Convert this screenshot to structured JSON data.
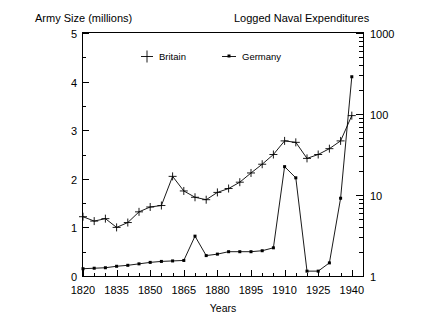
{
  "titles": {
    "left_title": "Army Size (millions)",
    "right_title": "Logged Naval Expenditures",
    "xlabel": "Years"
  },
  "legend": {
    "items": [
      {
        "label": "Britain",
        "marker": "plus-marker"
      },
      {
        "label": "Germany",
        "marker": "dot-line-marker"
      }
    ]
  },
  "axes": {
    "left_ticks": [
      "0",
      "1",
      "2",
      "3",
      "4",
      "5"
    ],
    "right_ticks": [
      "1",
      "10",
      "100",
      "1000"
    ],
    "x_ticks": [
      "1820",
      "1835",
      "1850",
      "1865",
      "1880",
      "1895",
      "1910",
      "1925",
      "1940"
    ]
  },
  "chart_data": {
    "type": "line",
    "title": "",
    "subtitle": "",
    "xlabel": "Years",
    "ylabel": "Army Size (millions)",
    "y2label": "Logged Naval Expenditures",
    "xlim": [
      1820,
      1945
    ],
    "ylim": [
      0,
      5
    ],
    "y2lim": [
      1,
      1000
    ],
    "y2scale": "log",
    "grid": false,
    "legend_position": "top-center-inside",
    "xticks": [
      1820,
      1835,
      1850,
      1865,
      1880,
      1895,
      1910,
      1925,
      1940
    ],
    "xminor_step": 5,
    "yticks": [
      0,
      1,
      2,
      3,
      4,
      5
    ],
    "y2ticks": [
      1,
      10,
      100,
      1000
    ],
    "series": [
      {
        "name": "Britain",
        "axis": "left",
        "marker": "plus",
        "x": [
          1820,
          1825,
          1830,
          1835,
          1840,
          1845,
          1850,
          1855,
          1860,
          1865,
          1870,
          1875,
          1880,
          1885,
          1890,
          1895,
          1900,
          1905,
          1910,
          1915,
          1920,
          1925,
          1930,
          1935,
          1940
        ],
        "values": [
          1.22,
          1.13,
          1.18,
          1.0,
          1.1,
          1.32,
          1.42,
          1.45,
          2.05,
          1.75,
          1.62,
          1.57,
          1.72,
          1.8,
          1.93,
          2.12,
          2.3,
          2.5,
          2.78,
          2.75,
          2.42,
          2.5,
          2.62,
          2.78,
          3.3
        ]
      },
      {
        "name": "Germany",
        "axis": "left",
        "marker": "dot",
        "x": [
          1820,
          1825,
          1830,
          1835,
          1840,
          1845,
          1850,
          1855,
          1860,
          1865,
          1870,
          1875,
          1880,
          1885,
          1890,
          1895,
          1900,
          1905,
          1910,
          1915,
          1920,
          1925,
          1930,
          1935,
          1940
        ],
        "values": [
          0.15,
          0.16,
          0.17,
          0.2,
          0.22,
          0.25,
          0.28,
          0.3,
          0.31,
          0.32,
          0.82,
          0.42,
          0.45,
          0.5,
          0.5,
          0.5,
          0.52,
          0.58,
          2.25,
          2.02,
          0.1,
          0.1,
          0.27,
          1.6,
          4.1
        ]
      }
    ],
    "series_right_axis_equivalent": {
      "note": "Germany values map to the right logarithmic scale 1..1000",
      "Germany_log_values": [
        1.35,
        1.4,
        1.45,
        1.6,
        1.7,
        1.85,
        2.0,
        2.1,
        2.15,
        2.2,
        7.6,
        3.0,
        3.2,
        3.7,
        3.7,
        3.7,
        3.9,
        4.4,
        90.0,
        55.0,
        1.05,
        1.05,
        2.0,
        25.0,
        300.0
      ]
    }
  },
  "colors": {
    "line": "#000000",
    "frame": "#000000",
    "background": "#ffffff"
  }
}
